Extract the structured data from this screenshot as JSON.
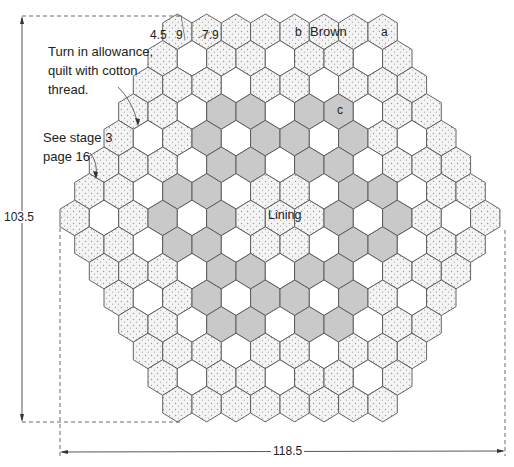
{
  "diagram": {
    "grid": {
      "orientation": "pointy-top",
      "row_counts": [
        8,
        9,
        10,
        11,
        12,
        13,
        14,
        15,
        14,
        13,
        12,
        11,
        10,
        9,
        8
      ],
      "legend_codes": {
        "D": "dotted (a)",
        "W": "white (b)",
        "G": "gray (c)"
      },
      "rows": [
        "DDDDDDDD",
        "DWDDWDDWD",
        "DDDWDDWDDD",
        "DDWGGWGGWDD",
        "DWDGWGGWGDWD",
        "DDDWGGWGGWDDD",
        "DDWGGWDDWGGWDD",
        "DWDGWGDDDGWGDWD",
        "DDWGGWDDWGGWDD",
        "DDDWGGWGGWDDD",
        "DWDGWGGWGDWD",
        "DDWGGWGGWDD",
        "DDDWDDWDDD",
        "DWDDWDDWD",
        "DDDDDDDD"
      ]
    },
    "colors": {
      "dotted_fill": "#f2f2f2",
      "dot_color": "#9a9a9a",
      "white_fill": "#ffffff",
      "gray_fill": "#c9c9c9",
      "outline": "#555555",
      "outer_outline": "#333333"
    },
    "hex_labels": {
      "dim_45": "4.5",
      "dim_9": "9",
      "dim_79": "7.9",
      "b": "b",
      "brown": "Brown",
      "a": "a",
      "c": "c",
      "lining": "Lining"
    },
    "annotations": {
      "turn_in_line1": "Turn in allowance,",
      "turn_in_line2": "quilt with cotton",
      "turn_in_line3": "thread.",
      "see_stage_line1": "See stage 3",
      "see_stage_line2": "page 16"
    },
    "dimensions": {
      "height": "103.5",
      "width": "118.5"
    }
  }
}
